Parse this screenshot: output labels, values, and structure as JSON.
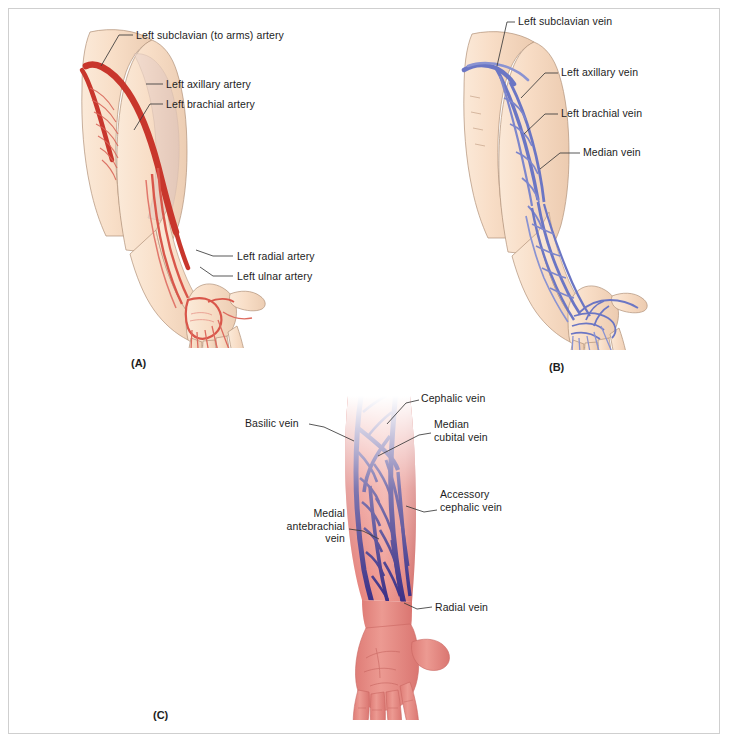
{
  "figure": {
    "width": 730,
    "height": 744,
    "background": "#ffffff",
    "border_color": "#cfcfcf",
    "type": "anatomical-illustration"
  },
  "colors": {
    "artery_red": "#c8362c",
    "artery_light": "#e58a7d",
    "skin_pale": "#f7dcc6",
    "skin_pale_shadow": "#eccdb3",
    "vein_blue": "#6b76c4",
    "vein_blue_dark": "#4d58a8",
    "skin_pink": "#e4857f",
    "skin_pink_dark": "#d2706c",
    "vein_purple": "#3b2f86",
    "label_text": "#1d1d1d",
    "leader_line": "#3a3a3a"
  },
  "panels": [
    {
      "id": "A",
      "letter": "(A)",
      "caption_position": {
        "x": 131,
        "y": 357
      },
      "vessel_type": "artery",
      "labels": [
        {
          "id": "left-subclavian-artery",
          "text": "Left subclavian (to arms) artery",
          "x": 136,
          "y": 29,
          "align": "left",
          "leader": [
            [
              133,
              35
            ],
            [
              119,
              35
            ],
            [
              101,
              66
            ]
          ]
        },
        {
          "id": "left-axillary-artery",
          "text": "Left axillary artery",
          "x": 166,
          "y": 79,
          "align": "left",
          "leader": [
            [
              163,
              84
            ],
            [
              148,
              84
            ]
          ]
        },
        {
          "id": "left-brachial-artery",
          "text": "Left brachial artery",
          "x": 166,
          "y": 99,
          "align": "left",
          "leader": [
            [
              163,
              104
            ],
            [
              150,
              104
            ],
            [
              134,
              130
            ]
          ]
        },
        {
          "id": "left-radial-artery",
          "text": "Left radial artery",
          "x": 236,
          "y": 250,
          "align": "left",
          "leader": [
            [
              233,
              256
            ],
            [
              214,
              256
            ],
            [
              196,
              250
            ]
          ]
        },
        {
          "id": "left-ulnar-artery",
          "text": "Left ulnar artery",
          "x": 236,
          "y": 270,
          "align": "left",
          "leader": [
            [
              233,
              276
            ],
            [
              214,
              276
            ],
            [
              199,
              268
            ]
          ]
        }
      ]
    },
    {
      "id": "B",
      "letter": "(B)",
      "caption_position": {
        "x": 549,
        "y": 361
      },
      "vessel_type": "vein",
      "labels": [
        {
          "id": "left-subclavian-vein",
          "text": "Left subclavian vein",
          "x": 518,
          "y": 16,
          "align": "left",
          "leader": [
            [
              515,
              22
            ],
            [
              508,
              22
            ],
            [
              497,
              66
            ]
          ]
        },
        {
          "id": "left-axillary-vein",
          "text": "Left axillary vein",
          "x": 561,
          "y": 67,
          "align": "left",
          "leader": [
            [
              558,
              73
            ],
            [
              545,
              73
            ],
            [
              523,
              98
            ]
          ]
        },
        {
          "id": "left-brachial-vein",
          "text": "Left brachial vein",
          "x": 561,
          "y": 108,
          "align": "left",
          "leader": [
            [
              558,
              114
            ],
            [
              545,
              114
            ],
            [
              525,
              134
            ]
          ]
        },
        {
          "id": "median-vein",
          "text": "Median vein",
          "x": 583,
          "y": 147,
          "align": "left",
          "leader": [
            [
              580,
              153
            ],
            [
              560,
              153
            ],
            [
              541,
              168
            ]
          ]
        }
      ]
    },
    {
      "id": "C",
      "letter": "(C)",
      "caption_position": {
        "x": 153,
        "y": 709
      },
      "vessel_type": "vein-superficial",
      "labels": [
        {
          "id": "cephalic-vein",
          "text": "Cephalic vein",
          "x": 421,
          "y": 393,
          "align": "left",
          "leader": [
            [
              419,
              400
            ],
            [
              408,
              403
            ],
            [
              388,
              425
            ]
          ]
        },
        {
          "id": "basilic-vein",
          "text": "Basilic vein",
          "x": 245,
          "y": 417,
          "align": "left",
          "leader": [
            [
              308,
              424
            ],
            [
              322,
              427
            ],
            [
              353,
              440
            ]
          ]
        },
        {
          "id": "median-cubital-vein",
          "text": "Median\ncubital vein",
          "x": 434,
          "y": 419,
          "align": "left",
          "leader": [
            [
              431,
              432
            ],
            [
              420,
              434
            ],
            [
              379,
              455
            ]
          ]
        },
        {
          "id": "accessory-cephalic-vein",
          "text": "Accessory\ncephalic vein",
          "x": 440,
          "y": 489,
          "align": "left",
          "leader": [
            [
              437,
              510
            ],
            [
              424,
              512
            ],
            [
              405,
              508
            ]
          ]
        },
        {
          "id": "medial-antebrachial-vein",
          "text": "Medial\nantebrachial\nvein",
          "x": 265,
          "y": 508,
          "align": "right",
          "width": 80,
          "leader": [
            [
              349,
              529
            ],
            [
              362,
              531
            ],
            [
              377,
              538
            ]
          ]
        },
        {
          "id": "radial-vein",
          "text": "Radial vein",
          "x": 435,
          "y": 601,
          "align": "left",
          "leader": [
            [
              432,
              607
            ],
            [
              418,
              609
            ],
            [
              405,
              604
            ]
          ]
        }
      ]
    }
  ]
}
